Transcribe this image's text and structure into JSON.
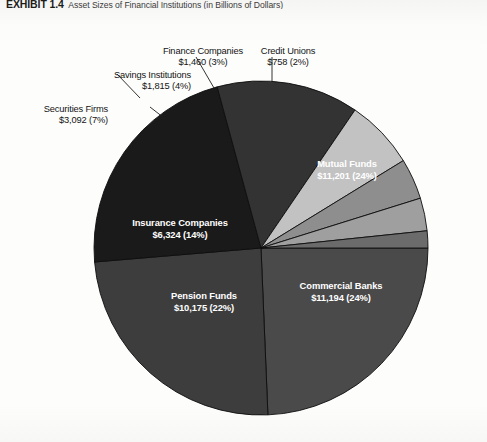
{
  "header": {
    "exhibit_label": "EXHIBIT 1.4",
    "title": "Asset Sizes of Financial Institutions (in Billions of Dollars)"
  },
  "chart_data": {
    "type": "pie",
    "title": "Asset Sizes of Financial Institutions (in Billions of Dollars)",
    "unit": "Billions of Dollars",
    "legend": "none",
    "labels_inside_slices": true,
    "categories": [
      "Mutual Funds",
      "Commercial Banks",
      "Pension Funds",
      "Insurance Companies",
      "Securities Firms",
      "Savings Institutions",
      "Finance Companies",
      "Credit Unions"
    ],
    "values": [
      11201,
      11194,
      10175,
      6324,
      3092,
      1815,
      1460,
      758
    ],
    "percents": [
      24,
      24,
      22,
      14,
      7,
      4,
      3,
      2
    ],
    "colors": [
      "#4a4a4a",
      "#3d3d3d",
      "#1a1a1a",
      "#333333",
      "#c2c2c2",
      "#8e8e8e",
      "#9f9f9f",
      "#6b6b6b"
    ],
    "slices": [
      {
        "name": "Mutual Funds",
        "value_text": "$11,201 (24%)",
        "value": 11201,
        "percent": 24,
        "color": "#4a4a4a",
        "label_placement": "inside",
        "label_color": "#ffffff"
      },
      {
        "name": "Commercial Banks",
        "value_text": "$11,194 (24%)",
        "value": 11194,
        "percent": 24,
        "color": "#3d3d3d",
        "label_placement": "inside",
        "label_color": "#ffffff"
      },
      {
        "name": "Pension Funds",
        "value_text": "$10,175 (22%)",
        "value": 10175,
        "percent": 22,
        "color": "#1a1a1a",
        "label_placement": "inside",
        "label_color": "#ffffff"
      },
      {
        "name": "Insurance Companies",
        "value_text": "$6,324 (14%)",
        "value": 6324,
        "percent": 14,
        "color": "#333333",
        "label_placement": "inside",
        "label_color": "#ffffff"
      },
      {
        "name": "Securities Firms",
        "value_text": "$3,092 (7%)",
        "value": 3092,
        "percent": 7,
        "color": "#c2c2c2",
        "label_placement": "outside",
        "label_color": "#141414"
      },
      {
        "name": "Savings Institutions",
        "value_text": "$1,815 (4%)",
        "value": 1815,
        "percent": 4,
        "color": "#8e8e8e",
        "label_placement": "outside",
        "label_color": "#141414"
      },
      {
        "name": "Finance Companies",
        "value_text": "$1,460 (3%)",
        "value": 1460,
        "percent": 3,
        "color": "#9f9f9f",
        "label_placement": "outside",
        "label_color": "#141414"
      },
      {
        "name": "Credit Unions",
        "value_text": "$758 (2%)",
        "value": 758,
        "percent": 2,
        "color": "#6b6b6b",
        "label_placement": "outside",
        "label_color": "#141414"
      }
    ]
  },
  "geometry": {
    "center_x": 261,
    "center_y": 234,
    "radius": 167,
    "start_angle_deg": 0,
    "direction": "clockwise"
  }
}
